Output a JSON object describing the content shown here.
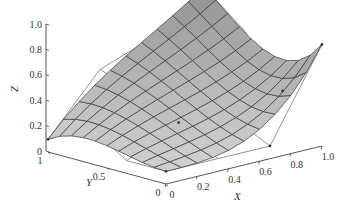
{
  "chart_data": {
    "type": "surface3d",
    "title": "",
    "xlabel": "X",
    "ylabel": "Y",
    "zlabel": "Z",
    "x_ticks": [
      "0",
      "0.2",
      "0.4",
      "0.6",
      "0.8",
      "1.0"
    ],
    "y_ticks": [
      "0",
      "0.5",
      "1"
    ],
    "z_ticks": [
      "0",
      "0.2",
      "0.4",
      "0.6",
      "0.8",
      "1.0"
    ],
    "xlim": [
      0,
      1
    ],
    "ylim": [
      0,
      1
    ],
    "zlim": [
      0,
      1
    ],
    "surface": {
      "description": "Bicubic Bezier surface with control net shown",
      "corner_values": {
        "x0_y0": 0.1,
        "x1_y0": 0.8,
        "x0_y1": 0.1,
        "x1_y1": 1.0
      },
      "grid_lines": 10,
      "colors": {
        "face": "#c8c8c8",
        "edge": "#3a3a3a",
        "control_net": "#707070"
      }
    },
    "control_points_marked": [
      {
        "x": 1.0,
        "y": 1.0,
        "z": 1.0
      },
      {
        "x": 1.0,
        "y": 0.0,
        "z": 0.8
      },
      {
        "x": 0.0,
        "y": 1.0,
        "z": 0.1
      },
      {
        "x": 0.33,
        "y": 1.0,
        "z": 0.55
      },
      {
        "x": 0.67,
        "y": 0.0,
        "z": 0.1
      }
    ],
    "grid": false,
    "legend": null
  }
}
